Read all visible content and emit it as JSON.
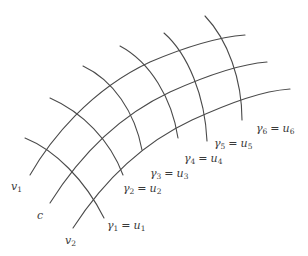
{
  "diagram": {
    "type": "curvilinear coordinate grid",
    "stroke_color": "#4a4a4a",
    "level_curves": [
      {
        "id": "v1",
        "label_base": "v",
        "label_sub": "1",
        "path": "M30,175 C50,140 90,90 150,62 C190,45 220,37 245,35"
      },
      {
        "id": "c",
        "label_base": "c",
        "label_sub": "",
        "path": "M50,203 C72,168 110,120 170,92 C210,74 240,64 267,62"
      },
      {
        "id": "v2",
        "label_base": "v",
        "label_sub": "2",
        "path": "M73,228 C95,194 132,148 192,120 C232,102 262,91 290,89"
      }
    ],
    "transversals": [
      {
        "id": "gamma1",
        "lhs_base": "γ",
        "lhs_sub": "1",
        "rhs_base": "u",
        "rhs_sub": "1",
        "path": "M25,138 C55,150 85,180 104,218"
      },
      {
        "id": "gamma2",
        "lhs_base": "γ",
        "lhs_sub": "2",
        "rhs_base": "u",
        "rhs_sub": "2",
        "path": "M50,98 C82,112 110,140 123,175"
      },
      {
        "id": "gamma3",
        "lhs_base": "γ",
        "lhs_sub": "3",
        "rhs_base": "u",
        "rhs_sub": "3",
        "path": "M83,66 C113,80 135,112 142,150"
      },
      {
        "id": "gamma4",
        "lhs_base": "γ",
        "lhs_sub": "4",
        "rhs_base": "u",
        "rhs_sub": "4",
        "path": "M120,46 C150,62 172,98 178,138"
      },
      {
        "id": "gamma5",
        "lhs_base": "γ",
        "lhs_sub": "5",
        "rhs_base": "u",
        "rhs_sub": "5",
        "path": "M164,33 C188,54 205,96 207,141"
      },
      {
        "id": "gamma6",
        "lhs_base": "γ",
        "lhs_sub": "6",
        "rhs_base": "u",
        "rhs_sub": "6",
        "path": "M205,16 C228,40 242,80 242,120"
      }
    ],
    "labels": {
      "v1": {
        "base": "v",
        "sub": "1"
      },
      "c": {
        "base": "c",
        "sub": ""
      },
      "v2": {
        "base": "v",
        "sub": "2"
      },
      "eq": "="
    }
  }
}
